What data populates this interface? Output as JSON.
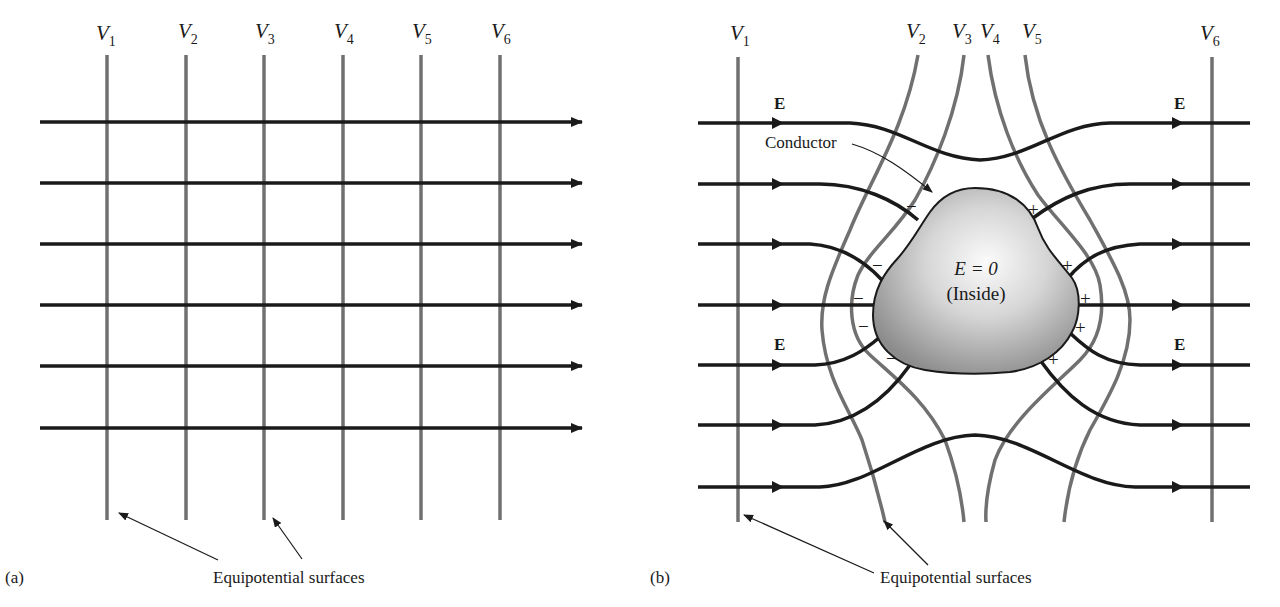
{
  "figure": {
    "panel_a": {
      "label": "(a)",
      "equipotential_labels": [
        {
          "main": "V",
          "sub": "1"
        },
        {
          "main": "V",
          "sub": "2"
        },
        {
          "main": "V",
          "sub": "3"
        },
        {
          "main": "V",
          "sub": "4"
        },
        {
          "main": "V",
          "sub": "5"
        },
        {
          "main": "V",
          "sub": "6"
        }
      ],
      "caption": "Equipotential surfaces",
      "field_line_count": 6
    },
    "panel_b": {
      "label": "(b)",
      "equipotential_labels": [
        {
          "main": "V",
          "sub": "1"
        },
        {
          "main": "V",
          "sub": "2"
        },
        {
          "main": "V",
          "sub": "3"
        },
        {
          "main": "V",
          "sub": "4"
        },
        {
          "main": "V",
          "sub": "5"
        },
        {
          "main": "V",
          "sub": "6"
        }
      ],
      "field_label": "E",
      "conductor_label": "Conductor",
      "inside_line1": "E = 0",
      "inside_line2": "(Inside)",
      "negative_sign": "−",
      "positive_sign": "+",
      "caption": "Equipotential surfaces",
      "field_line_count": 7
    },
    "colors": {
      "field_line": "#1a1a1a",
      "equipotential": "#707070",
      "conductor_light": "#f4f4f4",
      "conductor_dark": "#8a8a8a"
    }
  }
}
